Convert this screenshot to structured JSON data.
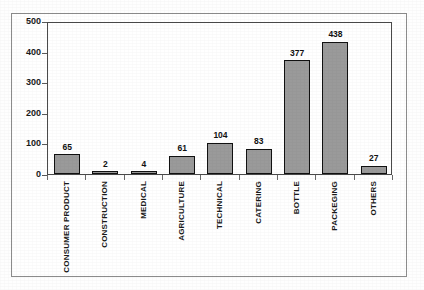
{
  "chart_data": {
    "type": "bar",
    "title": "",
    "subtitle": "",
    "xlabel": "",
    "ylabel": "",
    "ylim": [
      0,
      500
    ],
    "yticks": [
      0,
      100,
      200,
      300,
      400,
      500
    ],
    "grid": false,
    "legend": null,
    "categories": [
      "CONSUMER PRODUCT",
      "CONSTRUCTION",
      "MEDICAL",
      "AGRICULTURE",
      "TECHNICAL",
      "CATERING",
      "BOTTLE",
      "PACKEGING",
      "OTHERS"
    ],
    "values": [
      65,
      2,
      4,
      61,
      104,
      83,
      377,
      438,
      27
    ],
    "data_labels": [
      "65",
      "2",
      "4",
      "61",
      "104",
      "83",
      "377",
      "438",
      "27"
    ],
    "colors": {
      "bar_fill": "#9a9a9a",
      "bar_border": "#111111",
      "axis": "#4a4a4a",
      "text": "#1a1a1a",
      "frame": "#8c8c8c",
      "background": "#ffffff"
    }
  },
  "axis": {
    "y_tick_labels": [
      "500",
      "400",
      "300",
      "200",
      "100",
      "0"
    ]
  }
}
